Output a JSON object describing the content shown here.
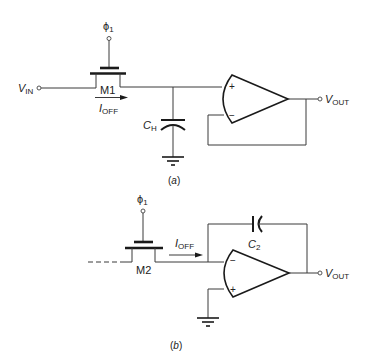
{
  "diagram": {
    "type": "circuit-schematic",
    "panels": [
      {
        "id": "a",
        "caption": "(a)",
        "clock_label": "ϕ",
        "clock_sub": "1",
        "input_label": "V",
        "input_sub": "IN",
        "transistor_label": "M1",
        "current_label": "I",
        "current_sub": "OFF",
        "capacitor_label": "C",
        "capacitor_sub": "H",
        "opamp_plus": "+",
        "opamp_minus": "−",
        "output_label": "V",
        "output_sub": "OUT",
        "description": "Sample-and-hold: M1 switch charges hold capacitor CH; unity-gain buffer op amp drives VOUT; leakage current IOFF flows through M1"
      },
      {
        "id": "b",
        "caption": "(b)",
        "clock_label": "ϕ",
        "clock_sub": "1",
        "transistor_label": "M2",
        "current_label": "I",
        "current_sub": "OFF",
        "capacitor_label": "C",
        "capacitor_sub": "2",
        "opamp_plus": "+",
        "opamp_minus": "−",
        "output_label": "V",
        "output_sub": "OUT",
        "description": "Integrator: M2 leakage current IOFF flows into inverting input; feedback capacitor C2; non-inverting input grounded"
      }
    ],
    "colors": {
      "line": "#3a3a3a",
      "text": "#222222",
      "background": "#ffffff"
    }
  }
}
